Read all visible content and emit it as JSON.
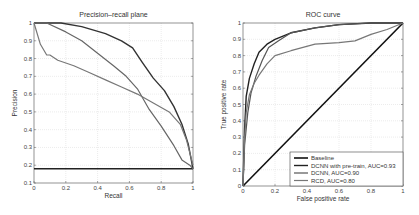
{
  "chart_data": [
    {
      "type": "line",
      "title": "Precision–recall plane",
      "xlabel": "Recall",
      "ylabel": "Precision",
      "xlim": [
        0,
        1
      ],
      "ylim": [
        0.1,
        1
      ],
      "xticks": [
        "0",
        "0.2",
        "0.4",
        "0.6",
        "0.8",
        "1"
      ],
      "yticks": [
        "0.1",
        "0.2",
        "0.3",
        "0.4",
        "0.5",
        "0.6",
        "0.7",
        "0.8",
        "0.9",
        "1"
      ],
      "grid": true,
      "series": [
        {
          "name": "Baseline",
          "color": "#222222",
          "x": [
            0,
            1
          ],
          "y": [
            0.18,
            0.18
          ]
        },
        {
          "name": "DCNN with pre-train",
          "color": "#333333",
          "x": [
            0,
            0.17,
            0.3,
            0.45,
            0.55,
            0.62,
            0.68,
            0.75,
            0.82,
            0.88,
            0.93,
            0.97,
            1.0
          ],
          "y": [
            1.0,
            1.0,
            0.98,
            0.94,
            0.9,
            0.86,
            0.78,
            0.69,
            0.62,
            0.53,
            0.43,
            0.32,
            0.18
          ]
        },
        {
          "name": "DCNN",
          "color": "#666666",
          "x": [
            0,
            0.08,
            0.2,
            0.3,
            0.4,
            0.5,
            0.58,
            0.65,
            0.72,
            0.8,
            0.88,
            0.93,
            0.98,
            1.0
          ],
          "y": [
            1.0,
            1.0,
            0.95,
            0.9,
            0.83,
            0.76,
            0.7,
            0.63,
            0.52,
            0.42,
            0.31,
            0.23,
            0.2,
            0.18
          ]
        },
        {
          "name": "RCD",
          "color": "#777777",
          "x": [
            0,
            0.04,
            0.08,
            0.1,
            0.15,
            0.25,
            0.35,
            0.45,
            0.55,
            0.65,
            0.75,
            0.85,
            0.92,
            0.96,
            1.0
          ],
          "y": [
            1.0,
            0.88,
            0.82,
            0.82,
            0.79,
            0.76,
            0.72,
            0.68,
            0.64,
            0.6,
            0.55,
            0.5,
            0.43,
            0.34,
            0.2
          ]
        }
      ]
    },
    {
      "type": "line",
      "title": "ROC curve",
      "xlabel": "False positive rate",
      "ylabel": "True positive rate",
      "xlim": [
        0,
        1
      ],
      "ylim": [
        0,
        1
      ],
      "xticks": [
        "0",
        "0.2",
        "0.4",
        "0.6",
        "0.8",
        "1"
      ],
      "yticks": [
        "0",
        "0.1",
        "0.2",
        "0.3",
        "0.4",
        "0.5",
        "0.6",
        "0.7",
        "0.8",
        "0.9",
        "1"
      ],
      "grid": true,
      "legend_position": "bottom-right",
      "series": [
        {
          "name": "Baseline",
          "color": "#111111",
          "x": [
            0,
            1
          ],
          "y": [
            0,
            1
          ]
        },
        {
          "name": "DCNN with pre-train, AUC=0.93",
          "color": "#222222",
          "x": [
            0,
            0.01,
            0.02,
            0.04,
            0.07,
            0.1,
            0.15,
            0.2,
            0.3,
            0.45,
            0.6,
            0.8,
            1.0
          ],
          "y": [
            0,
            0.35,
            0.55,
            0.66,
            0.75,
            0.82,
            0.87,
            0.9,
            0.94,
            0.97,
            0.99,
            1.0,
            1.0
          ]
        },
        {
          "name": "DCNN, AUC=0.90",
          "color": "#555555",
          "x": [
            0,
            0.01,
            0.03,
            0.05,
            0.08,
            0.12,
            0.16,
            0.22,
            0.3,
            0.45,
            0.6,
            0.8,
            1.0
          ],
          "y": [
            0,
            0.25,
            0.45,
            0.57,
            0.67,
            0.77,
            0.85,
            0.89,
            0.94,
            0.97,
            0.99,
            1.0,
            1.0
          ]
        },
        {
          "name": "RCD, AUC=0.80",
          "color": "#777777",
          "x": [
            0,
            0.01,
            0.02,
            0.04,
            0.07,
            0.1,
            0.15,
            0.2,
            0.3,
            0.45,
            0.6,
            0.7,
            0.8,
            0.9,
            1.0
          ],
          "y": [
            0,
            0.3,
            0.45,
            0.56,
            0.63,
            0.68,
            0.75,
            0.8,
            0.83,
            0.87,
            0.88,
            0.89,
            0.93,
            0.96,
            1.0
          ]
        }
      ]
    }
  ]
}
